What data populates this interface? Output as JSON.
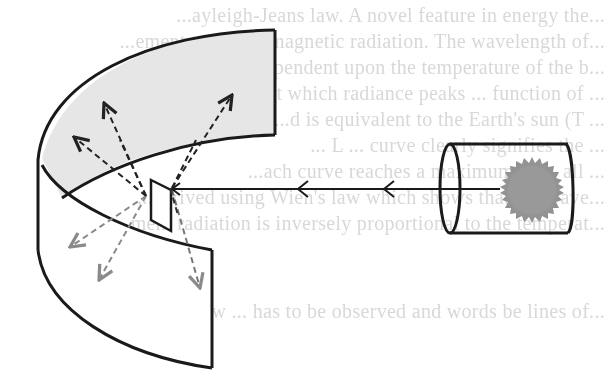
{
  "figure": {
    "type": "physics-illustration",
    "colors": {
      "stroke": "#1a1a1a",
      "band_fill": "#e6e6e6",
      "sun_fill": "#9a9a9a",
      "scatter_dark": "#222222",
      "scatter_light": "#8a8a8a",
      "ghost_text": "#d8d8d8"
    },
    "elements": {
      "source": "sun-icon",
      "enclosure": "cylinder",
      "incident_ray": "solid line with two left-pointing arrowheads",
      "target": "tilted rectangular plate",
      "screen": "curved band (upper half shaded gray, lower half white)",
      "scattered_rays": 8
    }
  },
  "bleed_through_text": {
    "lines": [
      "...ayleigh-Jeans law. A novel feature in energy the...",
      "...ement to electromagnetic radiation. The wavelength of...",
      "...radiation is dependent upon the temperature of the b...",
      "...n at which radiance peaks ... function of ...",
      "...d is equivalent to the Earth's sun (T ...",
      "... L ... curve clearly signifies the ...",
      "...ach curve reaches a maximum of ... all ...",
      "...derived using Wien's law which shows that the wave...",
      "...ment radiation is inversely proportional to the temperat...",
      "...ow ... has to be observed and words be lines of..."
    ]
  }
}
